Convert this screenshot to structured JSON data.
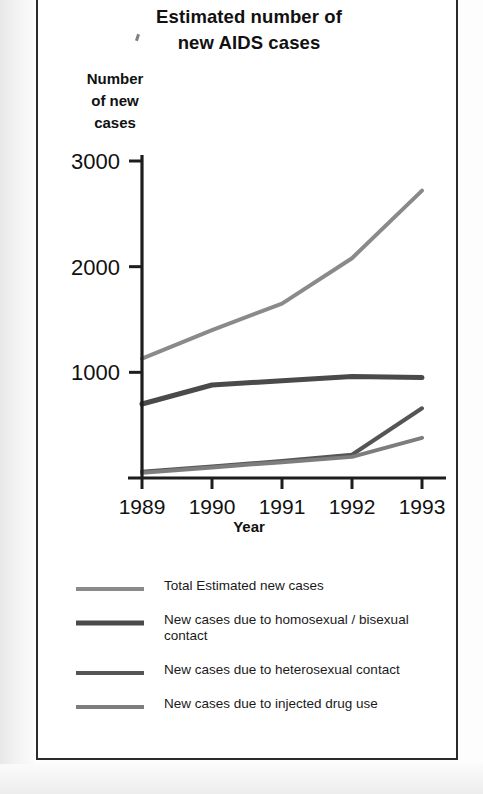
{
  "figure": {
    "title_line1": "Estimated number of",
    "title_line2": "new AIDS cases",
    "y_axis_title_line1": "Number",
    "y_axis_title_line2": "of new",
    "y_axis_title_line3": "cases",
    "x_axis_title": "Year"
  },
  "chart_data": {
    "type": "line",
    "title": "Estimated number of new AIDS cases",
    "xlabel": "Year",
    "ylabel": "Number of new cases",
    "x": [
      "1989",
      "1990",
      "1991",
      "1992",
      "1993"
    ],
    "categories": [
      "1989",
      "1990",
      "1991",
      "1992",
      "1993"
    ],
    "xlim": [
      1989,
      1993
    ],
    "ylim": [
      0,
      3000
    ],
    "yticks": [
      1000,
      2000,
      3000
    ],
    "ytick_labels": [
      "1000",
      "2000",
      "3000"
    ],
    "grid": false,
    "legend_position": "below",
    "series": [
      {
        "name": "Total Estimated new cases",
        "color": "#8a8a8a",
        "width": 4,
        "values": [
          1130,
          1400,
          1650,
          2080,
          2720
        ]
      },
      {
        "name": "New cases due to homosexual / bisexual contact",
        "color": "#4a4a4a",
        "width": 5,
        "values": [
          700,
          880,
          920,
          960,
          950
        ]
      },
      {
        "name": "New cases due to heterosexual contact",
        "color": "#555555",
        "width": 4,
        "values": [
          60,
          110,
          160,
          220,
          660
        ]
      },
      {
        "name": "New cases due to injected drug use",
        "color": "#7d7d7d",
        "width": 4,
        "values": [
          50,
          100,
          150,
          200,
          380
        ]
      }
    ]
  },
  "legend": {
    "items": [
      {
        "label": "Total Estimated new cases",
        "color": "#8a8a8a",
        "thickness": 4
      },
      {
        "label": "New cases due to homosexual / bisexual contact",
        "color": "#4a4a4a",
        "thickness": 5
      },
      {
        "label": "New cases due to heterosexual contact",
        "color": "#555555",
        "thickness": 4
      },
      {
        "label": "New cases due to injected drug use",
        "color": "#7d7d7d",
        "thickness": 4
      }
    ]
  },
  "axis": {
    "y_tick_labels": [
      "3000",
      "2000",
      "1000"
    ],
    "x_tick_labels": [
      "1989",
      "1990",
      "1991",
      "1992",
      "1993"
    ]
  }
}
